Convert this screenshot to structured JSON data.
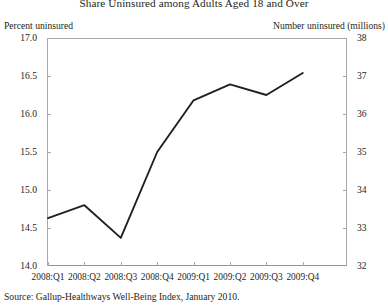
{
  "chart_data": {
    "type": "line",
    "title": "Share Uninsured among Adults Aged 18 and Over",
    "xlabel": "",
    "ylabel": "Percent uninsured",
    "y2label": "Number uninsured (millions)",
    "categories": [
      "2008:Q1",
      "2008:Q2",
      "2008:Q3",
      "2008:Q4",
      "2009:Q1",
      "2009:Q2",
      "2009:Q3",
      "2009:Q4"
    ],
    "values": [
      14.63,
      14.8,
      14.37,
      15.5,
      16.18,
      16.39,
      16.25,
      16.54
    ],
    "ylim": [
      14.0,
      17.0
    ],
    "yticks": [
      "14.0",
      "14.5",
      "15.0",
      "15.5",
      "16.0",
      "16.5",
      "17.0"
    ],
    "y2lim": [
      32,
      38
    ],
    "y2ticks": [
      "32",
      "33",
      "34",
      "35",
      "36",
      "37",
      "38"
    ],
    "grid": false,
    "legend": "none",
    "line_color": "#231f20",
    "source": "Source:  Gallup-Healthways Well-Being Index, January 2010."
  }
}
